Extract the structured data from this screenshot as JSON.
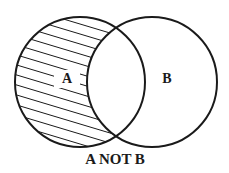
{
  "diagram": {
    "type": "venn",
    "title": "A NOT B",
    "sets": [
      {
        "label": "A",
        "shaded": "exclusive region"
      },
      {
        "label": "B",
        "shaded": "none"
      }
    ],
    "caption": "A NOT B",
    "colors": {
      "stroke": "#1a1a1a",
      "background": "#ffffff"
    }
  }
}
